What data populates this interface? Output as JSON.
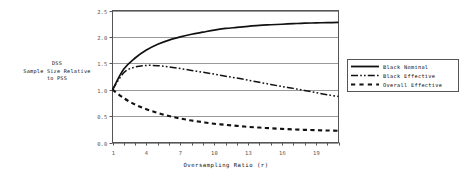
{
  "chart_data": {
    "type": "line",
    "title": "",
    "xlabel": "Oversampling Ratio (r)",
    "ylabel": "DSS\nSample Size Relative\nto PSS",
    "ylabel_lines": [
      "DSS",
      "Sample Size Relative",
      "to PSS"
    ],
    "xlim": [
      1,
      21
    ],
    "ylim": [
      0.0,
      2.5
    ],
    "xticks": [
      1,
      2,
      3,
      4,
      5,
      6,
      7,
      8,
      9,
      10,
      11,
      12,
      13,
      14,
      15,
      16,
      17,
      18,
      19,
      20,
      21
    ],
    "xtick_labels": [
      "1",
      "",
      "",
      "4",
      "",
      "",
      "7",
      "",
      "",
      "10",
      "",
      "",
      "13",
      "",
      "",
      "16",
      "",
      "",
      "19",
      "",
      ""
    ],
    "xtick_labels_shown": [
      "1",
      "4",
      "7",
      "10",
      "13",
      "16",
      "19"
    ],
    "yticks": [
      0.0,
      0.5,
      1.0,
      1.5,
      2.0,
      2.5
    ],
    "ytick_labels": [
      "0.0",
      "0.5",
      "1.0",
      "1.5",
      "2.0",
      "2.5"
    ],
    "grid": "horizontal",
    "legend_position": "right",
    "x": [
      1,
      2,
      3,
      4,
      5,
      6,
      7,
      8,
      9,
      10,
      11,
      12,
      13,
      14,
      15,
      16,
      17,
      18,
      19,
      20,
      21
    ],
    "series": [
      {
        "name": "Black Nominal",
        "style": "solid",
        "color": "#111111",
        "values": [
          1.0,
          1.39,
          1.6,
          1.75,
          1.86,
          1.94,
          2.0,
          2.05,
          2.09,
          2.13,
          2.16,
          2.18,
          2.2,
          2.22,
          2.23,
          2.24,
          2.25,
          2.26,
          2.265,
          2.27,
          2.275
        ]
      },
      {
        "name": "Black Effective",
        "style": "dash-dot-dot",
        "color": "#111111",
        "values": [
          1.0,
          1.32,
          1.43,
          1.46,
          1.455,
          1.43,
          1.4,
          1.365,
          1.33,
          1.295,
          1.255,
          1.22,
          1.18,
          1.14,
          1.1,
          1.06,
          1.025,
          0.985,
          0.945,
          0.905,
          0.87
        ]
      },
      {
        "name": "Overall Effective",
        "style": "dashed",
        "color": "#111111",
        "values": [
          1.0,
          0.84,
          0.72,
          0.63,
          0.56,
          0.5,
          0.455,
          0.415,
          0.385,
          0.355,
          0.335,
          0.315,
          0.297,
          0.283,
          0.27,
          0.258,
          0.248,
          0.24,
          0.233,
          0.227,
          0.222
        ]
      }
    ]
  },
  "legend": {
    "entries": [
      {
        "label": "Black Nominal",
        "style": "solid"
      },
      {
        "label": "Black Effective",
        "style": "dash-dot-dot"
      },
      {
        "label": "Overall Effective",
        "style": "dashed"
      }
    ]
  },
  "axis": {
    "x_title": "Oversampling Ratio (r)",
    "y_title_line1": "DSS",
    "y_title_line2": "Sample Size Relative",
    "y_title_line3": "to PSS"
  },
  "colors": {
    "line": "#111111",
    "grid": "#999999",
    "frame": "#555555",
    "text": "#111111",
    "tick_text": "#555555",
    "background": "#ffffff"
  }
}
